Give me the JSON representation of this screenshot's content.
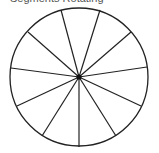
{
  "caption": "Segments Rotating",
  "diagram": {
    "type": "segmented-circle",
    "center": [
      79,
      77
    ],
    "radius": 69,
    "segment_count": 11,
    "stroke_color": "#222222",
    "hub_color": "#111111",
    "spoke_endpoints": [
      [
        61,
        10
      ],
      [
        100,
        10
      ],
      [
        131,
        32
      ],
      [
        147,
        67
      ],
      [
        141,
        106
      ],
      [
        116,
        136
      ],
      [
        79,
        147
      ],
      [
        42,
        136
      ],
      [
        17,
        106
      ],
      [
        11,
        68
      ],
      [
        28,
        32
      ]
    ]
  }
}
